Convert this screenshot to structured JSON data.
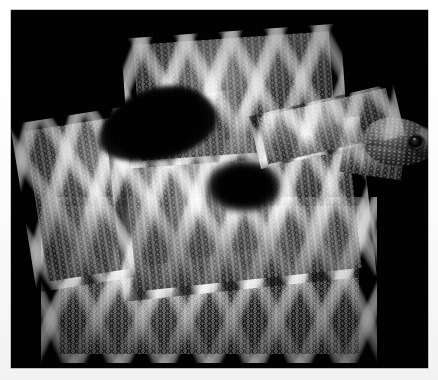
{
  "image": {
    "subject": "Rattlesnake, coiled",
    "description": "Black-and-white photograph of a coiled rattlesnake with diamond-patterned scales, head raised at right, against a solid black background",
    "medium": "monochrome photograph",
    "orientation": "landscape",
    "width_px": 438,
    "height_px": 380
  },
  "frame": {
    "mat_color": "#ffffff",
    "plate_color": "#000000",
    "plate_left_px": 11,
    "plate_top_px": 10,
    "plate_width_px": 417,
    "plate_height_px": 358,
    "border_hairline_color": "#8d8d8d"
  },
  "palette": {
    "background": "#000000",
    "scale_highlight": "#f8f8f8",
    "scale_midtone": "#8a8a8a",
    "scale_shadow": "#1a1a1a",
    "eye": "#060606",
    "mat": "#ffffff"
  },
  "subject_parts": {
    "coil_bottom_label": "front lower coil",
    "coil_left_label": "left outer coil",
    "coil_mid_label": "central coil",
    "coil_top_label": "upper rear coil",
    "neck_label": "neck",
    "head_label": "head",
    "eye_label": "eye",
    "nostril_label": "nostril",
    "snout_label": "snout",
    "jaw_label": "lower jaw"
  }
}
